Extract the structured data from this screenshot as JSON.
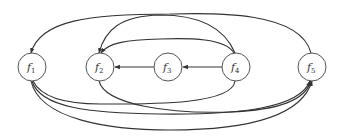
{
  "diagram": {
    "type": "directed-graph",
    "stroke_color": "#333333",
    "node_stroke_color": "#555555",
    "background": "#ffffff",
    "nodes": [
      {
        "id": "f1",
        "base": "f",
        "sub": "1",
        "x": 32,
        "y": 67
      },
      {
        "id": "f2",
        "base": "f",
        "sub": "2",
        "x": 100,
        "y": 67
      },
      {
        "id": "f3",
        "base": "f",
        "sub": "3",
        "x": 168,
        "y": 67
      },
      {
        "id": "f4",
        "base": "f",
        "sub": "4",
        "x": 236,
        "y": 67
      },
      {
        "id": "f5",
        "base": "f",
        "sub": "5",
        "x": 312,
        "y": 67
      }
    ],
    "edges": [
      {
        "from": "f5",
        "to": "f1",
        "route": "top-outer-arc"
      },
      {
        "from": "f4",
        "to": "f1",
        "route": "top-arc"
      },
      {
        "from": "f4",
        "to": "f2",
        "route": "top-inner-arc"
      },
      {
        "from": "f3",
        "to": "f2",
        "route": "straight"
      },
      {
        "from": "f4",
        "to": "f3",
        "route": "straight"
      },
      {
        "from": "f4",
        "to": "f1",
        "route": "bottom-arc"
      },
      {
        "from": "f2",
        "to": "f5",
        "route": "bottom-arc"
      },
      {
        "from": "f1",
        "to": "f5",
        "route": "bottom-arc"
      },
      {
        "from": "f1",
        "to": "f5",
        "route": "bottom-outer-arc"
      }
    ]
  }
}
